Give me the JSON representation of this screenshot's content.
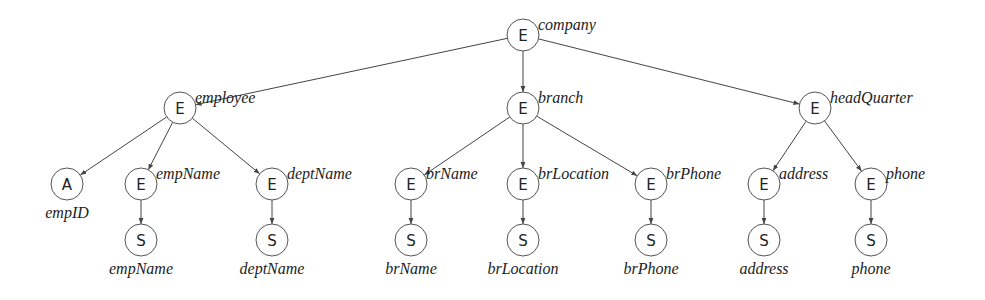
{
  "diagram": {
    "nodes": [
      {
        "id": "company",
        "type": "E",
        "label": "company",
        "x": 523,
        "y": 35,
        "label_pos": "right-top"
      },
      {
        "id": "employee",
        "type": "E",
        "label": "employee",
        "x": 180,
        "y": 108,
        "label_pos": "right-top"
      },
      {
        "id": "branch",
        "type": "E",
        "label": "branch",
        "x": 523,
        "y": 108,
        "label_pos": "right-top"
      },
      {
        "id": "headQuarter",
        "type": "E",
        "label": "headQuarter",
        "x": 815,
        "y": 108,
        "label_pos": "right-top"
      },
      {
        "id": "empID",
        "type": "A",
        "label": "empID",
        "x": 67,
        "y": 184,
        "label_pos": "below"
      },
      {
        "id": "empName",
        "type": "E",
        "label": "empName",
        "x": 141,
        "y": 184,
        "label_pos": "right-top"
      },
      {
        "id": "deptName",
        "type": "E",
        "label": "deptName",
        "x": 272,
        "y": 184,
        "label_pos": "right-top"
      },
      {
        "id": "brName",
        "type": "E",
        "label": "brName",
        "x": 411,
        "y": 184,
        "label_pos": "right-top"
      },
      {
        "id": "brLocation",
        "type": "E",
        "label": "brLocation",
        "x": 523,
        "y": 184,
        "label_pos": "right-top"
      },
      {
        "id": "brPhone",
        "type": "E",
        "label": "brPhone",
        "x": 651,
        "y": 184,
        "label_pos": "right-top"
      },
      {
        "id": "address",
        "type": "E",
        "label": "address",
        "x": 764,
        "y": 184,
        "label_pos": "right-top"
      },
      {
        "id": "phone",
        "type": "E",
        "label": "phone",
        "x": 871,
        "y": 184,
        "label_pos": "right-top"
      },
      {
        "id": "empName_s",
        "type": "S",
        "label": "empName",
        "x": 141,
        "y": 240,
        "label_pos": "below"
      },
      {
        "id": "deptName_s",
        "type": "S",
        "label": "deptName",
        "x": 272,
        "y": 240,
        "label_pos": "below"
      },
      {
        "id": "brName_s",
        "type": "S",
        "label": "brName",
        "x": 411,
        "y": 240,
        "label_pos": "below"
      },
      {
        "id": "brLocation_s",
        "type": "S",
        "label": "brLocation",
        "x": 523,
        "y": 240,
        "label_pos": "below"
      },
      {
        "id": "brPhone_s",
        "type": "S",
        "label": "brPhone",
        "x": 651,
        "y": 240,
        "label_pos": "below"
      },
      {
        "id": "address_s",
        "type": "S",
        "label": "address",
        "x": 764,
        "y": 240,
        "label_pos": "below"
      },
      {
        "id": "phone_s",
        "type": "S",
        "label": "phone",
        "x": 871,
        "y": 240,
        "label_pos": "below"
      }
    ],
    "edges": [
      [
        "company",
        "employee"
      ],
      [
        "company",
        "branch"
      ],
      [
        "company",
        "headQuarter"
      ],
      [
        "employee",
        "empID"
      ],
      [
        "employee",
        "empName"
      ],
      [
        "employee",
        "deptName"
      ],
      [
        "branch",
        "brName"
      ],
      [
        "branch",
        "brLocation"
      ],
      [
        "branch",
        "brPhone"
      ],
      [
        "headQuarter",
        "address"
      ],
      [
        "headQuarter",
        "phone"
      ],
      [
        "empName",
        "empName_s"
      ],
      [
        "deptName",
        "deptName_s"
      ],
      [
        "brName",
        "brName_s"
      ],
      [
        "brLocation",
        "brLocation_s"
      ],
      [
        "brPhone",
        "brPhone_s"
      ],
      [
        "address",
        "address_s"
      ],
      [
        "phone",
        "phone_s"
      ]
    ],
    "node_radius": 16,
    "colors": {
      "stroke": "#555555",
      "text": "#222222",
      "background": "#ffffff"
    }
  }
}
